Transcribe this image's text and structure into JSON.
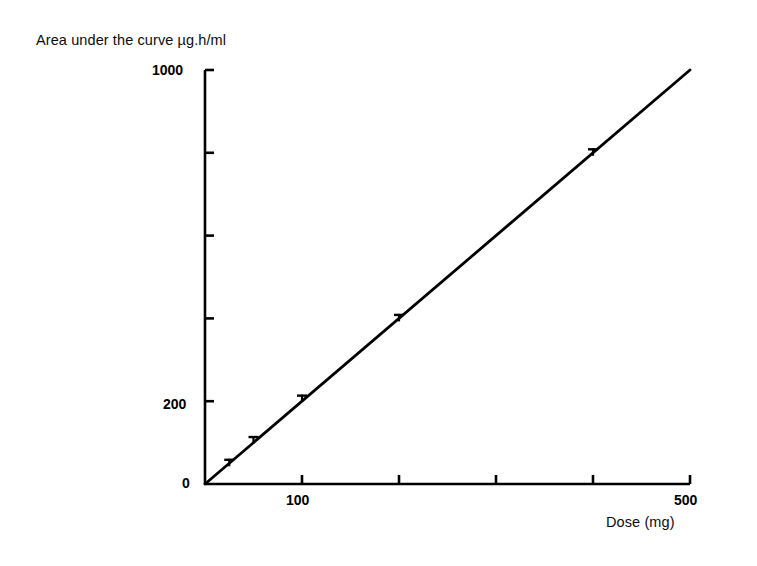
{
  "chart_data": {
    "type": "line",
    "title": "",
    "xlabel": "Dose (mg)",
    "ylabel": "Area under the curve µg.h/ml",
    "xlim": [
      0,
      500
    ],
    "ylim": [
      0,
      1000
    ],
    "grid": false,
    "legend": "none",
    "x_ticks": [
      0,
      100,
      200,
      300,
      400,
      500
    ],
    "x_tick_labels": [
      "0",
      "100",
      "",
      "",
      "",
      "500"
    ],
    "y_ticks": [
      0,
      200,
      400,
      600,
      800,
      1000
    ],
    "y_tick_labels": [
      "0",
      "200",
      "",
      "",
      "",
      "1000"
    ],
    "series": [
      {
        "name": "Area under the curve",
        "marker": "error-bar-cross",
        "x": [
          25,
          50,
          100,
          200,
          400
        ],
        "y": [
          50,
          105,
          205,
          400,
          800
        ]
      },
      {
        "name": "fitted line",
        "marker": "none",
        "x": [
          0,
          500
        ],
        "y": [
          0,
          1000
        ]
      }
    ]
  },
  "axis_titles": {
    "y": "Area under the curve µg.h/ml",
    "x": "Dose (mg)"
  },
  "tick_text": {
    "y_top": "1000",
    "y_mid": "200",
    "y_zero": "0",
    "x_hundred": "100",
    "x_fivehundred": "500"
  },
  "colors": {
    "ink": "#000000",
    "background": "#ffffff"
  }
}
